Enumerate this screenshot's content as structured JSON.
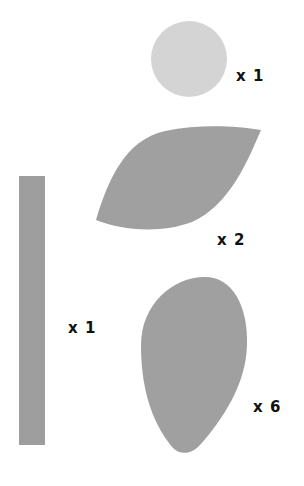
{
  "diagram": {
    "title": "",
    "background": "#ffffff",
    "pieces": [
      {
        "id": "circle",
        "shape": "circle",
        "color": "#d4d4d4",
        "count_label": "x 1",
        "count": 1
      },
      {
        "id": "leaf",
        "shape": "leaf",
        "color": "#a0a0a0",
        "count_label": "x 2",
        "count": 2
      },
      {
        "id": "stem",
        "shape": "rectangle",
        "color": "#9e9e9e",
        "count_label": "x 1",
        "count": 1
      },
      {
        "id": "petal",
        "shape": "egg",
        "color": "#a0a0a0",
        "count_label": "x 6",
        "count": 6
      }
    ],
    "label_color": "#111111"
  }
}
